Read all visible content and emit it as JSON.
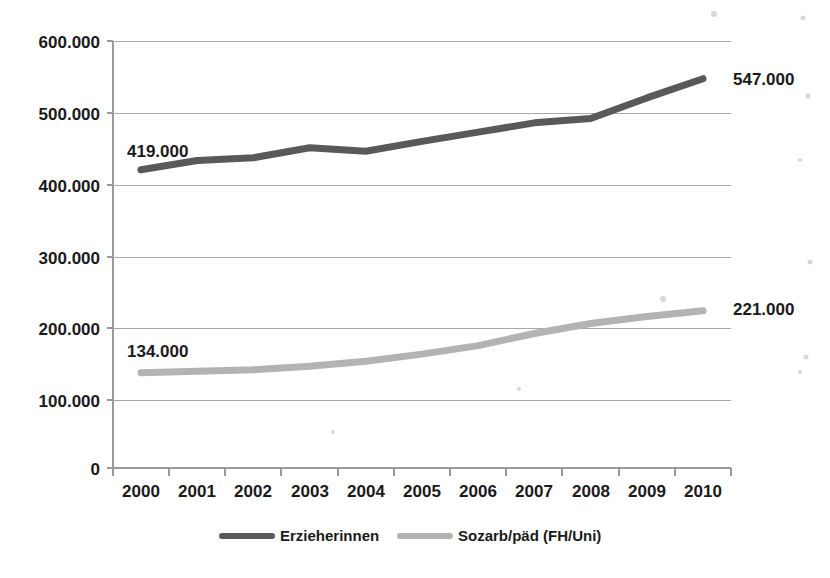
{
  "chart_data": {
    "type": "line",
    "title": "",
    "subtitle": "",
    "xlabel": "",
    "ylabel": "",
    "categories": [
      "2000",
      "2001",
      "2002",
      "2003",
      "2004",
      "2005",
      "2006",
      "2007",
      "2008",
      "2009",
      "2010"
    ],
    "x": [
      2000,
      2001,
      2002,
      2003,
      2004,
      2005,
      2006,
      2007,
      2008,
      2009,
      2010
    ],
    "ylim": [
      0,
      600000
    ],
    "y_ticks": [
      0,
      100000,
      200000,
      300000,
      400000,
      500000,
      600000
    ],
    "y_tick_labels": [
      "0",
      "100.000",
      "200.000",
      "300.000",
      "400.000",
      "500.000",
      "600.000"
    ],
    "grid": true,
    "legend_position": "bottom",
    "series": [
      {
        "name": "Erzieherinnen",
        "color": "#595959",
        "values": [
          419000,
          432000,
          436000,
          450000,
          445000,
          459000,
          472000,
          485000,
          491000,
          520000,
          547000
        ]
      },
      {
        "name": "Sozarb/päd (FH/Uni)",
        "color": "#b3b3b3",
        "values": [
          134000,
          136000,
          138000,
          143000,
          150000,
          160000,
          172000,
          189000,
          203000,
          213000,
          221000
        ]
      }
    ],
    "annotations": [
      {
        "text": "419.000",
        "series": "Erzieherinnen",
        "point": "2000",
        "value": 419000,
        "position": "above-right"
      },
      {
        "text": "547.000",
        "series": "Erzieherinnen",
        "point": "2010",
        "value": 547000,
        "position": "right"
      },
      {
        "text": "134.000",
        "series": "Sozarb/päd (FH/Uni)",
        "point": "2000",
        "value": 134000,
        "position": "above-right"
      },
      {
        "text": "221.000",
        "series": "Sozarb/päd (FH/Uni)",
        "point": "2010",
        "value": 221000,
        "position": "right"
      }
    ]
  },
  "axes": {
    "y_labels": [
      "600.000",
      "500.000",
      "400.000",
      "300.000",
      "200.000",
      "100.000",
      "0"
    ],
    "x_labels": [
      "2000",
      "2001",
      "2002",
      "2003",
      "2004",
      "2005",
      "2006",
      "2007",
      "2008",
      "2009",
      "2010"
    ]
  },
  "legend": {
    "items": [
      {
        "label": "Erzieherinnen",
        "color": "#595959"
      },
      {
        "label": "Sozarb/päd (FH/Uni)",
        "color": "#b3b3b3"
      }
    ]
  },
  "labels": {
    "start_dark": "419.000",
    "end_dark": "547.000",
    "start_light": "134.000",
    "end_light": "221.000"
  }
}
